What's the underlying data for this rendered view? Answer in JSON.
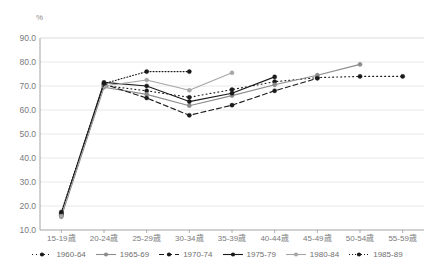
{
  "chart_data": {
    "type": "line",
    "title": "",
    "subtitle": "",
    "xlabel": "",
    "ylabel": "%",
    "unit_label": "%",
    "ylim": [
      10.0,
      90.0
    ],
    "ystep": 10.0,
    "grid": true,
    "legend_position": "bottom",
    "categories": [
      "15-19歳",
      "20-24歳",
      "25-29歳",
      "30-34歳",
      "35-39歳",
      "40-44歳",
      "45-49歳",
      "50-54歳",
      "55-59歳"
    ],
    "ytick_labels": [
      "90.0",
      "80.0",
      "70.0",
      "60.0",
      "50.0",
      "40.0",
      "30.0",
      "20.0",
      "10.0"
    ],
    "ytick_values": [
      90.0,
      80.0,
      70.0,
      60.0,
      50.0,
      40.0,
      30.0,
      20.0,
      10.0
    ],
    "series": [
      {
        "name": "1960-64",
        "color": "#1a1a1a",
        "dash": "1,3",
        "marker": "circle",
        "values": [
          16.0,
          70.2,
          68.0,
          65.3,
          68.5,
          71.8,
          73.5,
          74.0,
          74.0
        ]
      },
      {
        "name": "1965-69",
        "color": "#8c8c8c",
        "dash": "none",
        "marker": "circle",
        "values": [
          15.5,
          69.5,
          66.5,
          61.8,
          66.0,
          70.5,
          74.5,
          79.0,
          null
        ]
      },
      {
        "name": "1970-74",
        "color": "#1a1a1a",
        "dash": "5,3",
        "marker": "circle",
        "values": [
          16.5,
          70.8,
          65.0,
          57.8,
          62.0,
          68.0,
          73.2,
          null,
          null
        ]
      },
      {
        "name": "1975-79",
        "color": "#1a1a1a",
        "dash": "none",
        "marker": "circle",
        "values": [
          17.0,
          71.5,
          70.0,
          63.5,
          67.0,
          73.8,
          null,
          null,
          null
        ]
      },
      {
        "name": "1980-84",
        "color": "#a6a6a6",
        "dash": "none",
        "marker": "circle",
        "values": [
          16.0,
          70.0,
          72.5,
          68.2,
          75.5,
          null,
          null,
          null,
          null
        ]
      },
      {
        "name": "1985-89",
        "color": "#1a1a1a",
        "dash": "1,2",
        "marker": "circle",
        "values": [
          17.5,
          71.0,
          76.0,
          76.0,
          null,
          null,
          null,
          null,
          null
        ]
      }
    ]
  },
  "legend": {
    "items": [
      {
        "label": "1960-64"
      },
      {
        "label": "1965-69"
      },
      {
        "label": "1970-74"
      },
      {
        "label": "1975-79"
      },
      {
        "label": "1980-84"
      },
      {
        "label": "1985-89"
      }
    ]
  }
}
